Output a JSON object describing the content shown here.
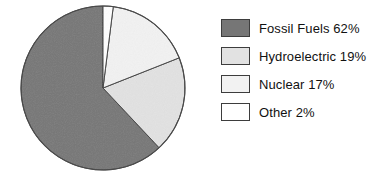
{
  "chart_data": {
    "type": "pie",
    "title": "",
    "subtitle": "",
    "xlabel": "",
    "ylabel": "",
    "grid": false,
    "legend_position": "right",
    "units": "percent",
    "start_angle_deg": 0,
    "direction": "counterclockwise",
    "categories": [
      "Fossil Fuels",
      "Hydroelectric",
      "Nuclear",
      "Other"
    ],
    "values": [
      62,
      19,
      17,
      2
    ],
    "colors": [
      "#767676",
      "#e2e2e2",
      "#f2f2f2",
      "#ffffff"
    ],
    "edge_color": "#3d3d3d",
    "slices": [
      {
        "label": "Fossil Fuels",
        "value": 62,
        "value_text": "62%",
        "color": "#767676"
      },
      {
        "label": "Hydroelectric",
        "value": 19,
        "value_text": "19%",
        "color": "#e2e2e2"
      },
      {
        "label": "Nuclear",
        "value": 17,
        "value_text": "17%",
        "color": "#f2f2f2"
      },
      {
        "label": "Other",
        "value": 2,
        "value_text": "2%",
        "color": "#ffffff"
      }
    ]
  },
  "legend": {
    "items": [
      {
        "label": "Fossil Fuels 62%",
        "swatch_color": "#767676",
        "swatch_name": "legend-swatch-fossil-fuels"
      },
      {
        "label": "Hydroelectric 19%",
        "swatch_color": "#e2e2e2",
        "swatch_name": "legend-swatch-hydroelectric"
      },
      {
        "label": "Nuclear 17%",
        "swatch_color": "#f2f2f2",
        "swatch_name": "legend-swatch-nuclear"
      },
      {
        "label": "Other 2%",
        "swatch_color": "#ffffff",
        "swatch_name": "legend-swatch-other"
      }
    ]
  },
  "pie_geometry": {
    "cx": 103,
    "cy": 88,
    "r": 82
  }
}
